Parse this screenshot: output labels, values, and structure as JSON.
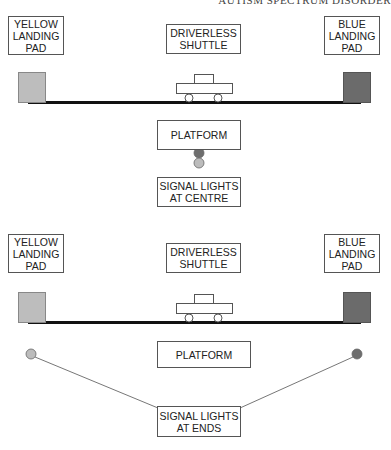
{
  "header": {
    "text": "AUTISM SPECTRUM DISORDER"
  },
  "colors": {
    "yellow_pad": "#bdbdbd",
    "blue_pad": "#6b6b6b",
    "track": "#111111",
    "outline": "#555555",
    "light_dark": "#6e6e6e",
    "light_light": "#bcbcbc",
    "connector": "#777777"
  },
  "diagrams": [
    {
      "name": "signal-lights-at-centre",
      "labels": {
        "yellow_pad": "YELLOW\nLANDING\nPAD",
        "shuttle": "DRIVERLESS\nSHUTTLE",
        "blue_pad": "BLUE\nLANDING\nPAD",
        "platform": "PLATFORM",
        "signal": "SIGNAL LIGHTS\nAT CENTRE"
      },
      "boxes": {
        "yellow_pad": {
          "x": 8,
          "y": 16,
          "w": 56,
          "h": 39
        },
        "shuttle": {
          "x": 166,
          "y": 24,
          "w": 75,
          "h": 30
        },
        "blue_pad": {
          "x": 324,
          "y": 16,
          "w": 56,
          "h": 39
        },
        "platform": {
          "x": 157,
          "y": 120,
          "w": 84,
          "h": 30
        },
        "signal": {
          "x": 157,
          "y": 177,
          "w": 84,
          "h": 30
        }
      },
      "track_y": 102,
      "pad_top": 72,
      "shuttle_x": 176,
      "lights": [
        {
          "cx": 199,
          "cy": 153,
          "tone": "dark"
        },
        {
          "cx": 199,
          "cy": 163,
          "tone": "light"
        }
      ],
      "connectors": []
    },
    {
      "name": "signal-lights-at-ends",
      "labels": {
        "yellow_pad": "YELLOW\nLANDING\nPAD",
        "shuttle": "DRIVERLESS\nSHUTTLE",
        "blue_pad": "BLUE\nLANDING\nPAD",
        "platform": "PLATFORM",
        "signal": "SIGNAL LIGHTS\nAT ENDS"
      },
      "boxes": {
        "yellow_pad": {
          "x": 8,
          "y": 234,
          "w": 56,
          "h": 39
        },
        "shuttle": {
          "x": 166,
          "y": 243,
          "w": 75,
          "h": 30
        },
        "blue_pad": {
          "x": 324,
          "y": 234,
          "w": 56,
          "h": 39
        },
        "platform": {
          "x": 157,
          "y": 341,
          "w": 94,
          "h": 27
        },
        "signal": {
          "x": 157,
          "y": 406,
          "w": 84,
          "h": 31
        }
      },
      "track_y": 322,
      "pad_top": 292,
      "shuttle_x": 176,
      "lights": [
        {
          "cx": 31,
          "cy": 354,
          "tone": "light"
        },
        {
          "cx": 357,
          "cy": 354,
          "tone": "dark"
        }
      ],
      "connectors": [
        {
          "x1": 35,
          "y1": 357,
          "x2": 158,
          "y2": 408
        },
        {
          "x1": 353,
          "y1": 357,
          "x2": 240,
          "y2": 408
        }
      ]
    }
  ]
}
